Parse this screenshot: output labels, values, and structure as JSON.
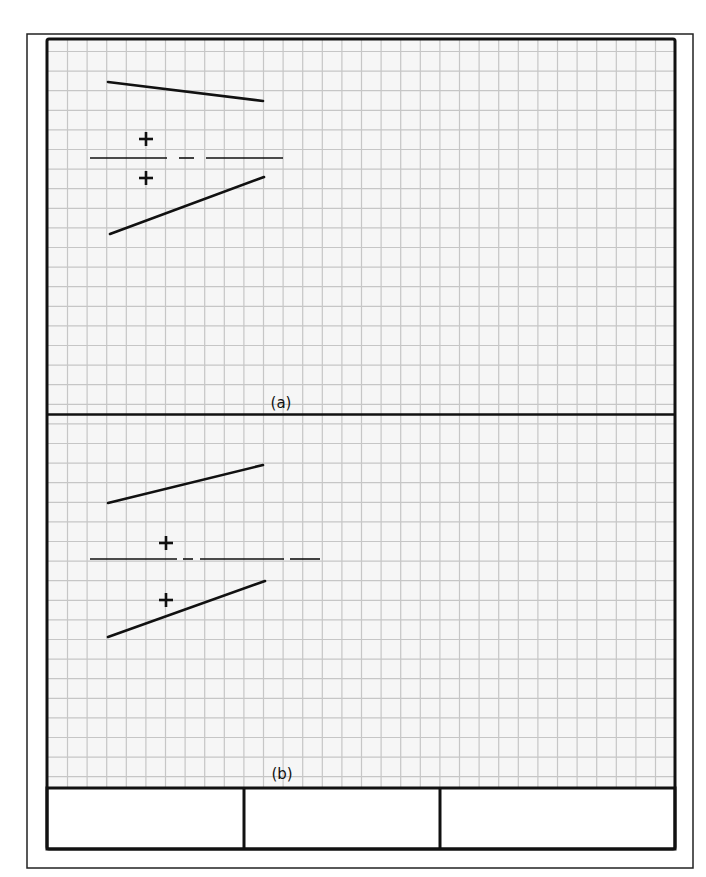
{
  "sheet": {
    "width": 706,
    "height": 877,
    "outer_frame": {
      "x": 27,
      "y": 34,
      "w": 666,
      "h": 834,
      "stroke": "#222222",
      "stroke_width": 1.5
    },
    "inner_box": {
      "x": 47,
      "y": 39,
      "w": 628,
      "h": 749,
      "stroke": "#111111",
      "stroke_width": 3
    },
    "grid": {
      "origin_x": 67.5,
      "origin_y": 51.5,
      "spacing": 19.6,
      "color": "#c6c6c6",
      "background": "#f6f6f6",
      "line_width": 1.2
    },
    "panel_divider": {
      "y": 414.5,
      "stroke_width": 2.5
    },
    "title_block": {
      "y": 788,
      "h": 61,
      "x": 47,
      "w": 628,
      "dividers_x": [
        244,
        440
      ],
      "cells": [
        "",
        "",
        ""
      ]
    }
  },
  "panels": [
    {
      "id": "a",
      "label": "(a)",
      "label_pos": {
        "x": 281,
        "y": 408
      },
      "lines": [
        {
          "x1": 108,
          "y1": 82,
          "x2": 263,
          "y2": 101,
          "width": 2.6
        },
        {
          "x1": 110,
          "y1": 234,
          "x2": 264,
          "y2": 177,
          "width": 2.6
        }
      ],
      "axis_segments": [
        {
          "x1": 90,
          "x2": 167,
          "y": 158
        },
        {
          "x1": 179,
          "x2": 194,
          "y": 158
        },
        {
          "x1": 206,
          "x2": 283,
          "y": 158
        }
      ],
      "plus_marks": [
        {
          "x": 146,
          "y": 139
        },
        {
          "x": 146,
          "y": 178
        }
      ]
    },
    {
      "id": "b",
      "label": "(b)",
      "label_pos": {
        "x": 282,
        "y": 779
      },
      "lines": [
        {
          "x1": 108,
          "y1": 503,
          "x2": 263,
          "y2": 465,
          "width": 2.6
        },
        {
          "x1": 108,
          "y1": 637,
          "x2": 265,
          "y2": 581,
          "width": 2.6
        }
      ],
      "axis_segments": [
        {
          "x1": 90,
          "x2": 177,
          "y": 559
        },
        {
          "x1": 183,
          "x2": 193,
          "y": 559
        },
        {
          "x1": 200,
          "x2": 284,
          "y": 559
        },
        {
          "x1": 290,
          "x2": 320,
          "y": 559
        }
      ],
      "plus_marks": [
        {
          "x": 166,
          "y": 543
        },
        {
          "x": 166,
          "y": 600
        }
      ]
    }
  ],
  "plus_size": 14,
  "plus_stroke": 2.6,
  "axis_stroke": 1.6,
  "ink_color": "#111111"
}
